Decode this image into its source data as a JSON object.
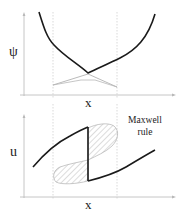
{
  "figure": {
    "title": "",
    "caption": "",
    "top_panel": {
      "ylabel": "ψ",
      "xlabel": "x",
      "curves": [
        {
          "name": "free-energy",
          "style": "solid-black-thick"
        },
        {
          "name": "tangent-lower-left",
          "style": "gray-thin"
        },
        {
          "name": "tangent-lower-right",
          "style": "gray-thin"
        }
      ],
      "dashed_verticals": 2
    },
    "bottom_panel": {
      "ylabel": "u",
      "xlabel": "x",
      "annotation": [
        "Maxwell",
        "rule"
      ],
      "curves": [
        {
          "name": "stress-strain-branch-left",
          "style": "solid-black-thick"
        },
        {
          "name": "jump",
          "style": "solid-black-thick"
        },
        {
          "name": "stress-strain-branch-right",
          "style": "solid-black-thick"
        }
      ],
      "hatched_regions": 2,
      "dashed_verticals": 2
    }
  },
  "colors": {
    "curve": "#1a1a1a",
    "axis": "#b8b8b8",
    "guide": "#c8c8c8",
    "gray_line": "#a8a8a8",
    "hatch": "#9a9a9a"
  }
}
